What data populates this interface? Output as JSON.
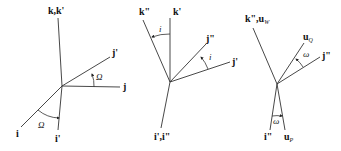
{
  "diagram": {
    "type": "euler-angle-rotation-sequence",
    "panels": [
      {
        "id": "rotation-1",
        "angle_label": "Ω",
        "axes": [
          {
            "label": "k,k'"
          },
          {
            "label": "j'"
          },
          {
            "label": "j"
          },
          {
            "label": "i"
          },
          {
            "label": "i'"
          }
        ],
        "angle_labels": [
          "Ω",
          "Ω"
        ]
      },
      {
        "id": "rotation-2",
        "angle_label": "i",
        "axes": [
          {
            "label": "k\""
          },
          {
            "label": "k'"
          },
          {
            "label": "j\""
          },
          {
            "label": "j'"
          },
          {
            "label": "i',i\""
          }
        ],
        "angle_labels": [
          "i",
          "i"
        ]
      },
      {
        "id": "rotation-3",
        "angle_label": "ω",
        "axes": [
          {
            "label": "k\",u",
            "sub": "W"
          },
          {
            "label": "u",
            "sub": "Q"
          },
          {
            "label": "j\""
          },
          {
            "label": "i\""
          },
          {
            "label": "u",
            "sub": "P"
          }
        ],
        "angle_labels": [
          "ω",
          "ω"
        ]
      }
    ]
  }
}
